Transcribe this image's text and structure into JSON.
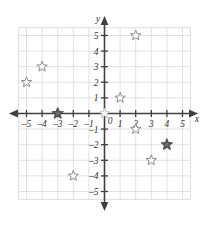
{
  "chart_data": {
    "type": "scatter",
    "title": "",
    "xlabel": "x",
    "ylabel": "y",
    "xlim": [
      -5.6,
      5.6
    ],
    "ylim": [
      -5.6,
      5.6
    ],
    "grid": true,
    "legend": "none",
    "x_ticks": [
      -5,
      -4,
      -3,
      -2,
      -1,
      1,
      2,
      3,
      4,
      5
    ],
    "y_ticks": [
      5,
      4,
      3,
      2,
      1,
      -1,
      -2,
      -3,
      -4,
      -5
    ],
    "x_tick_labels": [
      "–5",
      "–4",
      "–3",
      "–2",
      "–1",
      "1",
      "2",
      "3",
      "4",
      "5"
    ],
    "y_tick_labels": [
      "5",
      "4",
      "3",
      "2",
      "1",
      "–1",
      "–2",
      "–3",
      "–4",
      "–5"
    ],
    "origin_label": "0",
    "series": [
      {
        "name": "open-stars",
        "marker": "star-outline",
        "color": "#8c8c8c",
        "points": [
          {
            "x": -5,
            "y": 2
          },
          {
            "x": -4,
            "y": 3
          },
          {
            "x": 1,
            "y": 1
          },
          {
            "x": 2,
            "y": 5
          },
          {
            "x": 2,
            "y": -1
          },
          {
            "x": 3,
            "y": -3
          },
          {
            "x": -2,
            "y": -4
          }
        ]
      },
      {
        "name": "faint-stars",
        "marker": "star-outline-faint",
        "color": "#c0c0c0",
        "points": [
          {
            "x": 0,
            "y": 0
          }
        ]
      },
      {
        "name": "filled-stars",
        "marker": "star-filled",
        "color": "#6b6b6b",
        "points": [
          {
            "x": -3,
            "y": 0
          },
          {
            "x": 4,
            "y": -2
          }
        ]
      }
    ]
  },
  "axes": {
    "x_axis_label": "x",
    "y_axis_label": "y",
    "origin": "0"
  },
  "colors": {
    "grid": "#d9d9d9",
    "axis": "#404040",
    "star_outline": "#8c8c8c",
    "star_fill": "#6b6b6b",
    "background": "#ffffff"
  }
}
